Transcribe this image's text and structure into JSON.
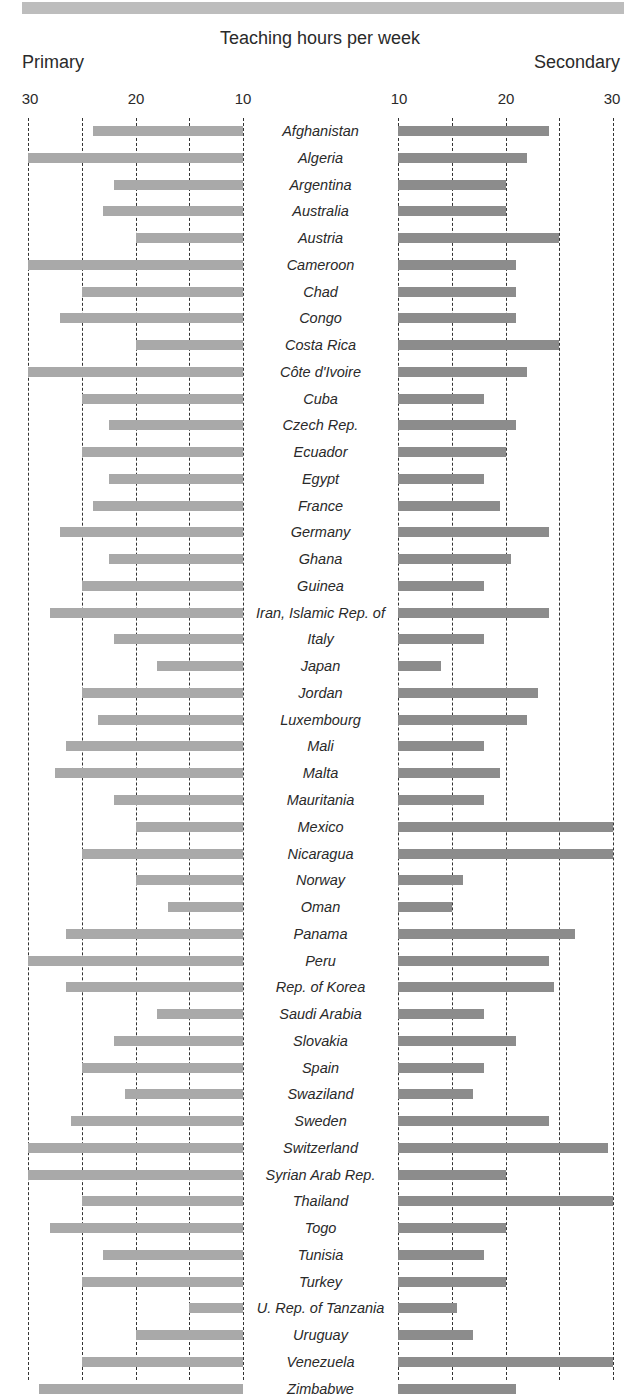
{
  "chart_data": {
    "type": "bar",
    "orientation": "horizontal-butterfly",
    "title": "Teaching hours per week",
    "left_label": "Primary",
    "right_label": "Secondary",
    "left_ticks": [
      "30",
      "20",
      "10"
    ],
    "right_ticks": [
      "10",
      "20",
      "30"
    ],
    "xlim": [
      10,
      30
    ],
    "grid": "dashed vertical at 10,15,20,25,30",
    "colors": {
      "primary": "#a9a9a9",
      "secondary": "#8c8c8c"
    },
    "categories": [
      "Afghanistan",
      "Algeria",
      "Argentina",
      "Australia",
      "Austria",
      "Cameroon",
      "Chad",
      "Congo",
      "Costa Rica",
      "Côte d'Ivoire",
      "Cuba",
      "Czech Rep.",
      "Ecuador",
      "Egypt",
      "France",
      "Germany",
      "Ghana",
      "Guinea",
      "Iran, Islamic Rep. of",
      "Italy",
      "Japan",
      "Jordan",
      "Luxembourg",
      "Mali",
      "Malta",
      "Mauritania",
      "Mexico",
      "Nicaragua",
      "Norway",
      "Oman",
      "Panama",
      "Peru",
      "Rep. of Korea",
      "Saudi Arabia",
      "Slovakia",
      "Spain",
      "Swaziland",
      "Sweden",
      "Switzerland",
      "Syrian Arab Rep.",
      "Thailand",
      "Togo",
      "Tunisia",
      "Turkey",
      "U. Rep. of Tanzania",
      "Uruguay",
      "Venezuela",
      "Zimbabwe"
    ],
    "series": [
      {
        "name": "Primary",
        "values": [
          24,
          30,
          22,
          23,
          20,
          30,
          25,
          27,
          20,
          30,
          25,
          22.5,
          25,
          22.5,
          24,
          27,
          22.5,
          25,
          28,
          22,
          18,
          25,
          23.5,
          26.5,
          27.5,
          22,
          20,
          25,
          20,
          17,
          26.5,
          30,
          26.5,
          18,
          22,
          25,
          21,
          26,
          30,
          30,
          25,
          28,
          23,
          25,
          15,
          20,
          25,
          29
        ]
      },
      {
        "name": "Secondary",
        "values": [
          24,
          22,
          20,
          20,
          25,
          21,
          21,
          21,
          25,
          22,
          18,
          21,
          20,
          18,
          19.5,
          24,
          20.5,
          18,
          24,
          18,
          14,
          23,
          22,
          18,
          19.5,
          18,
          30,
          30,
          16,
          15,
          26.5,
          24,
          24.5,
          18,
          21,
          18,
          17,
          24,
          29.5,
          20,
          30,
          20,
          18,
          20,
          15.5,
          17,
          30,
          21
        ]
      }
    ]
  }
}
